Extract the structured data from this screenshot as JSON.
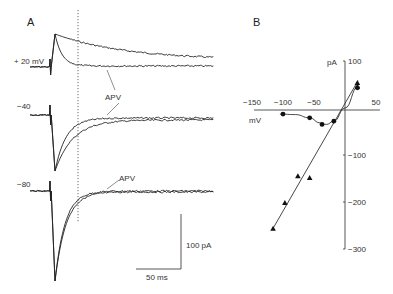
{
  "figure": {
    "panel_a_label": "A",
    "panel_b_label": "B"
  },
  "chart_data": [
    {
      "type": "line",
      "panel": "A",
      "title": "Synaptic currents at holding potentials, control vs APV",
      "scale_bar": {
        "x_label": "50 ms",
        "y_label": "100 pA"
      },
      "traces": [
        {
          "holding_label": "+ 20 mV",
          "holding_mV": 20,
          "series": [
            {
              "name": "control",
              "baseline": 67,
              "peak": 34,
              "tau_fast": 6,
              "slow_end": 60,
              "tau_slow": 70
            },
            {
              "name": "APV",
              "baseline": 67,
              "peak": 34,
              "tau_fast": 7,
              "slow_end": 66,
              "tau_slow": 0
            }
          ],
          "annotation": "APV"
        },
        {
          "holding_label": "−40",
          "holding_mV": -40,
          "series": [
            {
              "name": "control",
              "baseline": 115,
              "peak": 171,
              "tau_fast": 18,
              "slow_end": 120
            },
            {
              "name": "APV",
              "baseline": 115,
              "peak": 171,
              "tau_fast": 11,
              "slow_end": 118
            }
          ],
          "annotation": "APV"
        },
        {
          "holding_label": "−80",
          "holding_mV": -80,
          "series": [
            {
              "name": "control",
              "baseline": 191,
              "peak": 281,
              "tau_fast": 11,
              "slow_end": 192
            },
            {
              "name": "APV",
              "baseline": 191,
              "peak": 281,
              "tau_fast": 10,
              "slow_end": 191
            }
          ]
        }
      ],
      "dotted_marker": true
    },
    {
      "type": "scatter",
      "panel": "B",
      "title": "I–V relationship",
      "xlabel": "mV",
      "ylabel": "pA",
      "xlim": [
        -150,
        50
      ],
      "ylim": [
        -300,
        100
      ],
      "x_ticks": [
        -150,
        -100,
        -50,
        50
      ],
      "x_tick_labels": [
        "−150",
        "−100",
        "−50",
        "50"
      ],
      "y_ticks": [
        100,
        -100,
        -200,
        -300
      ],
      "y_tick_labels": [
        "100",
        "−100",
        "−200",
        "−300"
      ],
      "grid": false,
      "series": [
        {
          "name": "circles (APV-sensitive / NMDA)",
          "marker": "circle",
          "x": [
            -100,
            -57,
            -37,
            -18,
            20
          ],
          "y": [
            -13,
            -21,
            -35,
            -28,
            43
          ]
        },
        {
          "name": "triangles (control / non-NMDA)",
          "marker": "triangle",
          "x": [
            -76,
            -57,
            -97,
            -116,
            20,
            20
          ],
          "y": [
            -145,
            -149,
            -202,
            -257,
            53,
            45
          ]
        }
      ],
      "fit_line": {
        "x": [
          -116,
          21
        ],
        "y": [
          -256,
          58
        ]
      },
      "fit_curve": {
        "x": [
          -105,
          -80,
          -57,
          -40,
          -30,
          -18,
          0,
          21
        ],
        "y": [
          -13,
          -14,
          -21,
          -32,
          -35,
          -28,
          0,
          45
        ]
      }
    }
  ]
}
